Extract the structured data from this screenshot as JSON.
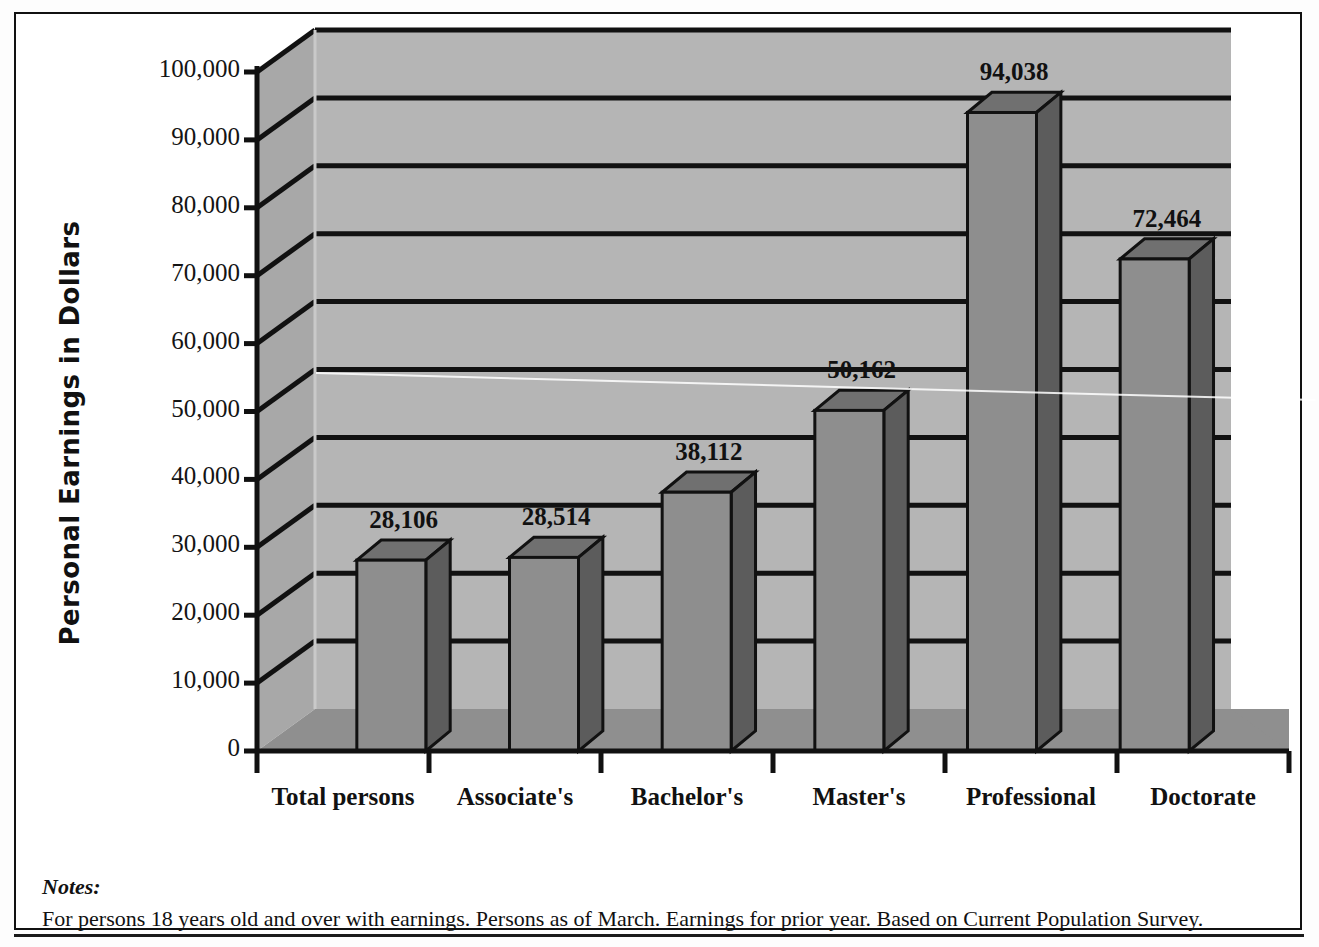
{
  "chart_data": {
    "type": "bar",
    "title": "",
    "xlabel": "",
    "ylabel": "Personal Earnings in Dollars",
    "categories": [
      "Total persons",
      "Associate's",
      "Bachelor's",
      "Master's",
      "Professional",
      "Doctorate"
    ],
    "values": [
      28106,
      28514,
      38112,
      50162,
      94038,
      72464
    ],
    "value_labels": [
      "28,106",
      "28,514",
      "38,112",
      "50,162",
      "94,038",
      "72,464"
    ],
    "ylim": [
      0,
      100000
    ],
    "ytick_values": [
      0,
      10000,
      20000,
      30000,
      40000,
      50000,
      60000,
      70000,
      80000,
      90000,
      100000
    ],
    "ytick_labels": [
      "0",
      "10,000",
      "20,000",
      "30,000",
      "40,000",
      "50,000",
      "60,000",
      "70,000",
      "80,000",
      "90,000",
      "100,000"
    ],
    "grid": true,
    "legend": "none",
    "style": "3d-column",
    "colors": {
      "bar_front": "#8e8e8e",
      "bar_side": "#5c5c5c",
      "bar_top": "#707070",
      "back_wall": "#b5b5b5",
      "left_wall": "#a8a8a8",
      "floor": "#8f8f8f",
      "gridline": "#111111",
      "axis": "#111111",
      "text": "#111111"
    }
  },
  "notes": {
    "heading": "Notes:",
    "body": "For persons 18 years old and over with earnings. Persons as of March. Earnings for prior year. Based on Current Population Survey."
  }
}
